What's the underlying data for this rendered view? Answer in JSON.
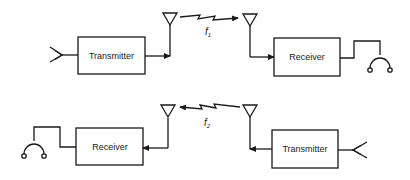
{
  "diagram": {
    "link_top": {
      "transmitter": {
        "label": "Transmitter"
      },
      "receiver": {
        "label": "Receiver"
      },
      "frequency_label": "f",
      "frequency_subscript": "1",
      "direction": "left-to-right"
    },
    "link_bottom": {
      "transmitter": {
        "label": "Transmitter"
      },
      "receiver": {
        "label": "Receiver"
      },
      "frequency_label": "f",
      "frequency_subscript": "2",
      "direction": "right-to-left"
    },
    "icons": {
      "microphone": "microphone-icon",
      "headphones": "headphones-icon",
      "antenna": "antenna-icon",
      "radio_wave": "lightning-wave-icon"
    },
    "colors": {
      "stroke": "#1a1a1a",
      "background": "#ffffff"
    }
  }
}
